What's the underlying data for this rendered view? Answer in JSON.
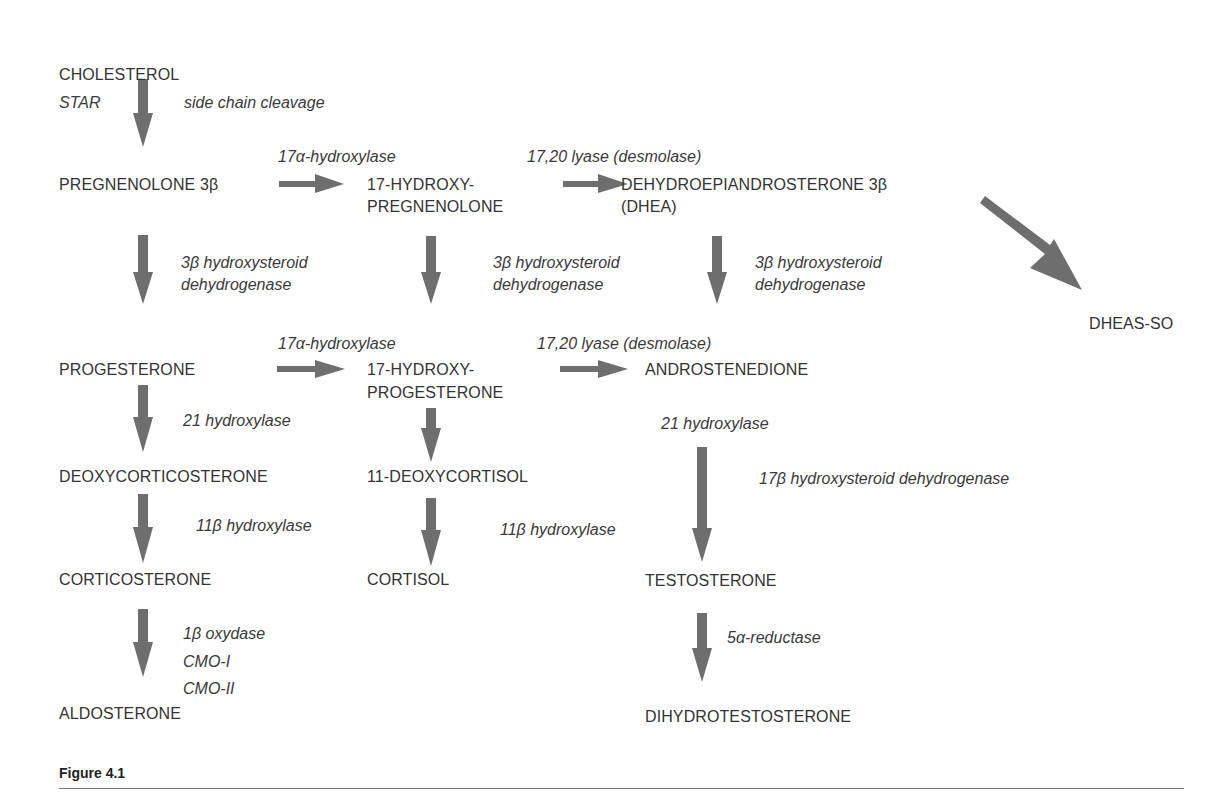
{
  "figure": {
    "caption": "Figure 4.1",
    "arrow_color": "#6e6e6e",
    "text_color": "#333333"
  },
  "nodes": {
    "cholesterol": "CHOLESTEROL",
    "pregnenolone": "PREGNENOLONE 3β",
    "hydroxypregnenolone_1": "17-HYDROXY-",
    "hydroxypregnenolone_2": "PREGNENOLONE",
    "dhea_1": "DEHYDROEPIANDROSTERONE 3β",
    "dhea_2": "(DHEA)",
    "dheas": "DHEAS-SO",
    "progesterone": "PROGESTERONE",
    "hydroxyprogesterone_1": "17-HYDROXY-",
    "hydroxyprogesterone_2": "PROGESTERONE",
    "androstenedione": "ANDROSTENEDIONE",
    "deoxycorticosterone": "DEOXYCORTICOSTERONE",
    "deoxycortisol": "11-DEOXYCORTISOL",
    "corticosterone": "CORTICOSTERONE",
    "cortisol": "CORTISOL",
    "testosterone": "TESTOSTERONE",
    "aldosterone": "ALDOSTERONE",
    "dihydrotestosterone": "DIHYDROTESTOSTERONE"
  },
  "enzymes": {
    "star": "STAR",
    "side_chain": "side chain cleavage",
    "hydroxylase17a_top": "17α-hydroxylase",
    "lyase_top": "17,20 lyase (desmolase)",
    "hsd3b_left_1": "3β hydroxysteroid",
    "hsd3b_left_2": "dehydrogenase",
    "hsd3b_mid_1": "3β hydroxysteroid",
    "hsd3b_mid_2": "dehydrogenase",
    "hsd3b_right_1": "3β hydroxysteroid",
    "hsd3b_right_2": "dehydrogenase",
    "hydroxylase17a_bottom": "17α-hydroxylase",
    "lyase_bottom": "17,20 lyase (desmolase)",
    "hydroxylase21_left": "21 hydroxylase",
    "hydroxylase21_right": "21 hydroxylase",
    "hsd17b": "17β hydroxysteroid dehydrogenase",
    "hydroxylase11b_left": "11β hydroxylase",
    "hydroxylase11b_mid": "11β hydroxylase",
    "oxydase_1": "1β oxydase",
    "oxydase_2": "CMO-I",
    "oxydase_3": "CMO-II",
    "reductase5a": "5α-reductase"
  }
}
